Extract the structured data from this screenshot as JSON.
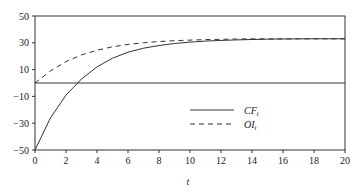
{
  "chart_data": {
    "type": "line",
    "title": "",
    "xlabel": "t",
    "ylabel": "",
    "xlim": [
      0,
      20
    ],
    "ylim": [
      -50,
      50
    ],
    "x_ticks": [
      0,
      2,
      4,
      6,
      8,
      10,
      12,
      14,
      16,
      18,
      20
    ],
    "y_ticks": [
      50,
      30,
      10,
      -10,
      -30,
      -50
    ],
    "y_tick_labels": [
      "50",
      "30",
      "10",
      "−10",
      "−30",
      "−50"
    ],
    "grid": false,
    "reference_line": {
      "y": 0
    },
    "legend": {
      "position": "lower-right-inside",
      "entries": [
        "CF_t",
        "OI_t"
      ]
    },
    "x": [
      0,
      1,
      2,
      3,
      4,
      5,
      6,
      7,
      8,
      9,
      10,
      11,
      12,
      13,
      14,
      15,
      16,
      17,
      18,
      19,
      20
    ],
    "series": [
      {
        "name": "CF_t",
        "style": "solid",
        "values": [
          -50,
          -26,
          -9,
          3,
          12,
          18.5,
          23,
          26,
          28,
          29.5,
          30.5,
          31.3,
          31.8,
          32.2,
          32.5,
          32.7,
          32.8,
          32.9,
          33,
          33,
          33
        ]
      },
      {
        "name": "OI_t",
        "style": "dashed",
        "values": [
          0,
          9,
          16,
          21,
          24.5,
          27,
          28.8,
          30,
          31,
          31.6,
          32,
          32.4,
          32.6,
          32.8,
          32.9,
          33,
          33,
          33,
          33,
          33,
          33
        ]
      }
    ]
  },
  "legend": {
    "cf_label": "CF",
    "cf_sub": "t",
    "oi_label": "OI",
    "oi_sub": "t"
  },
  "axis": {
    "x_title": "t"
  }
}
